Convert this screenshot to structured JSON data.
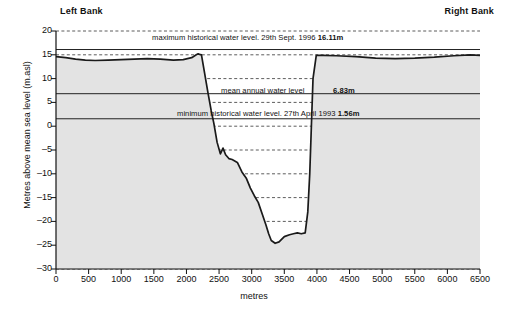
{
  "figure": {
    "left_bank_label": "Left Bank",
    "right_bank_label": "Right Bank",
    "ylabel": "Metres above mean sea level (m.asl)",
    "xlabel": "metres"
  },
  "annotations": {
    "max_level": "maximum historical water level. 29th Sept. 1996 ",
    "max_level_value": "16.11m",
    "mean_level": "mean annual water level",
    "mean_level_value": "6.83m",
    "min_level": "minimum historical water level. 27th April 1993 ",
    "min_level_value": "1.56m"
  },
  "colors": {
    "ground_fill": "#e3e3e3",
    "profile_line": "#1a1a1a",
    "grid": "#333333",
    "axis": "#111111"
  },
  "chart_data": {
    "type": "area",
    "title": "",
    "subtitle": "",
    "xlabel": "metres",
    "ylabel": "Metres above mean sea level (m.asl)",
    "xlim": [
      0,
      6500
    ],
    "ylim": [
      -30,
      20
    ],
    "xticks": [
      0,
      500,
      1000,
      1500,
      2000,
      2500,
      3000,
      3500,
      4000,
      4500,
      5000,
      5500,
      6000,
      6500
    ],
    "yticks": [
      20,
      15,
      10,
      5,
      0,
      -5,
      -10,
      -15,
      -20,
      -25,
      -30
    ],
    "grid": "horizontal-dashed",
    "legend": "none",
    "series": [
      {
        "name": "river bed / terrain cross-section",
        "x": [
          0,
          150,
          300,
          450,
          600,
          800,
          1000,
          1200,
          1400,
          1600,
          1800,
          1950,
          2080,
          2150,
          2180,
          2200,
          2230,
          2280,
          2330,
          2380,
          2420,
          2470,
          2520,
          2560,
          2600,
          2650,
          2700,
          2780,
          2850,
          2920,
          2980,
          3040,
          3100,
          3160,
          3220,
          3260,
          3300,
          3360,
          3420,
          3500,
          3580,
          3640,
          3700,
          3760,
          3820,
          3860,
          3890,
          3905,
          3920,
          3940,
          3990,
          4100,
          4300,
          4600,
          4900,
          5200,
          5500,
          5800,
          6100,
          6350,
          6500
        ],
        "y": [
          14.6,
          14.4,
          14.1,
          13.9,
          13.8,
          13.9,
          14.0,
          14.1,
          14.2,
          14.1,
          13.9,
          14.0,
          14.4,
          15.0,
          15.2,
          15.1,
          15.0,
          11.0,
          7.0,
          3.2,
          0.6,
          -3.4,
          -5.8,
          -4.6,
          -6.0,
          -6.8,
          -7.0,
          -7.6,
          -9.6,
          -11.0,
          -13.0,
          -14.6,
          -16.0,
          -18.4,
          -20.8,
          -22.6,
          -24.0,
          -24.6,
          -24.3,
          -23.2,
          -22.8,
          -22.6,
          -22.4,
          -22.6,
          -22.4,
          -18.0,
          -10.0,
          -4.0,
          2.0,
          10.0,
          14.9,
          14.9,
          14.8,
          14.6,
          14.3,
          14.2,
          14.3,
          14.5,
          14.8,
          15.0,
          14.9
        ],
        "note": "left bank plateau ~14-15 m.asl, channel incised to about -24.6 m.asl near 3360 m, right bank plateau ~14-15 m.asl"
      }
    ],
    "reference_lines": [
      {
        "name": "maximum historical water level",
        "value": 16.11,
        "date": "29th Sept. 1996",
        "label": "16.11m",
        "style": "solid"
      },
      {
        "name": "mean annual water level",
        "value": 6.83,
        "date": "",
        "label": "6.83m",
        "style": "solid"
      },
      {
        "name": "minimum historical water level",
        "value": 1.56,
        "date": "27th April 1993",
        "label": "1.56m",
        "style": "solid"
      }
    ]
  }
}
